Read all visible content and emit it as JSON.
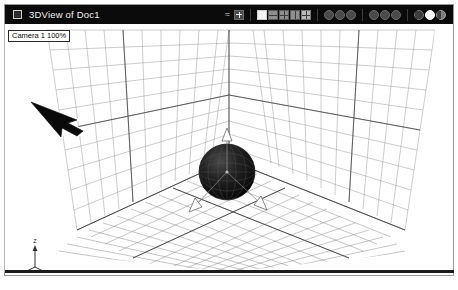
{
  "window": {
    "title": "3DView of Doc1",
    "sysicon": "window-menu-icon"
  },
  "toolbar": {
    "items": [
      {
        "name": "curve-tool-icon",
        "label": "≈"
      },
      {
        "name": "move-gizmo-icon",
        "label": "✥"
      },
      {
        "name": "shading-wireframe-icon",
        "label": ""
      },
      {
        "name": "shading-hidden-line-icon",
        "label": ""
      },
      {
        "name": "shading-flat-icon",
        "label": ""
      },
      {
        "name": "shading-smooth-icon",
        "label": ""
      },
      {
        "name": "shading-textured-icon",
        "label": ""
      },
      {
        "name": "render-preview-icon",
        "label": ""
      },
      {
        "name": "render-region-icon",
        "label": ""
      },
      {
        "name": "render-final-icon",
        "label": ""
      },
      {
        "name": "light-toggle-icon",
        "label": ""
      },
      {
        "name": "ambient-light-icon",
        "label": ""
      },
      {
        "name": "shadow-toggle-icon",
        "label": ""
      },
      {
        "name": "material-sphere-dark-icon",
        "label": ""
      },
      {
        "name": "material-sphere-light-icon",
        "label": ""
      },
      {
        "name": "material-sphere-gray-icon",
        "label": ""
      }
    ]
  },
  "viewport": {
    "camera_label": "Camera 1 100%",
    "scene_objects": [
      {
        "name": "ground-grid",
        "type": "grid-plane"
      },
      {
        "name": "left-wall-grid",
        "type": "grid-plane"
      },
      {
        "name": "right-wall-grid",
        "type": "grid-plane"
      },
      {
        "name": "sphere-object",
        "type": "sphere",
        "shading": "solid-dark"
      },
      {
        "name": "transform-gizmo",
        "type": "axis-handles"
      },
      {
        "name": "pointer-arrow",
        "type": "cursor"
      },
      {
        "name": "axis-triad",
        "type": "orientation-gizmo"
      }
    ],
    "axis_triad": {
      "x_label": "X",
      "y_label": "Y",
      "z_label": "Z"
    }
  },
  "colors": {
    "titlebar_bg": "#0b0b0b",
    "titlebar_text": "#efefef",
    "viewport_bg": "#ffffff",
    "grid_line": "#8c8c8c",
    "grid_major": "#4a4a4a",
    "object_fill": "#141414",
    "frame_border": "#9a9a9a"
  }
}
